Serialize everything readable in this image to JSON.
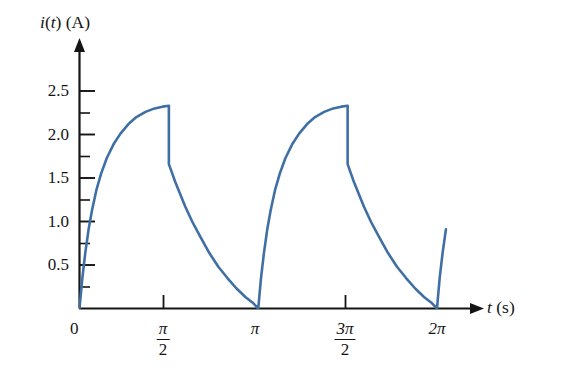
{
  "chart_data": {
    "type": "line",
    "title": "",
    "subtitle": "",
    "xlabel": "t (s)",
    "ylabel": "i(t) (A)",
    "xlim": [
      0,
      6.9115
    ],
    "ylim": [
      0,
      2.75
    ],
    "grid": false,
    "legend": null,
    "line_color": "#3f6fa5",
    "axis_color": "#141414",
    "period": 3.1416,
    "peak_value": 2.33,
    "x_ticks": [
      {
        "value": 0,
        "label": "0",
        "kind": "major"
      },
      {
        "value": 1.5708,
        "label": "pi/2",
        "kind": "major"
      },
      {
        "value": 3.1416,
        "label": "pi",
        "kind": "major"
      },
      {
        "value": 4.7124,
        "label": "3pi/2",
        "kind": "major"
      },
      {
        "value": 6.2832,
        "label": "2pi",
        "kind": "major"
      }
    ],
    "y_ticks": [
      {
        "value": 0.25,
        "label": "",
        "kind": "minor"
      },
      {
        "value": 0.5,
        "label": "0.5",
        "kind": "major"
      },
      {
        "value": 0.75,
        "label": "",
        "kind": "minor"
      },
      {
        "value": 1.0,
        "label": "1.0",
        "kind": "major"
      },
      {
        "value": 1.25,
        "label": "",
        "kind": "minor"
      },
      {
        "value": 1.5,
        "label": "1.5",
        "kind": "major"
      },
      {
        "value": 1.75,
        "label": "",
        "kind": "minor"
      },
      {
        "value": 2.0,
        "label": "2.0",
        "kind": "major"
      },
      {
        "value": 2.25,
        "label": "",
        "kind": "minor"
      },
      {
        "value": 2.5,
        "label": "2.5",
        "kind": "major"
      }
    ],
    "series": [
      {
        "name": "i(t)",
        "x": [
          0.0,
          0.05,
          0.1,
          0.16,
          0.22,
          0.3,
          0.38,
          0.48,
          0.6,
          0.72,
          0.86,
          1.0,
          1.16,
          1.32,
          1.46,
          1.5708,
          1.5708,
          1.62,
          1.68,
          1.76,
          1.86,
          1.98,
          2.12,
          2.28,
          2.44,
          2.6,
          2.76,
          2.92,
          3.04,
          3.1416,
          3.1416,
          3.19,
          3.24,
          3.3,
          3.36,
          3.44,
          3.52,
          3.62,
          3.74,
          3.86,
          4.0,
          4.14,
          4.3,
          4.46,
          4.6,
          4.7124,
          4.7124,
          4.76,
          4.82,
          4.9,
          5.0,
          5.12,
          5.26,
          5.42,
          5.58,
          5.74,
          5.9,
          6.06,
          6.18,
          6.2832,
          6.2832,
          6.33,
          6.38,
          6.44
        ],
        "y": [
          0.0,
          0.35,
          0.63,
          0.91,
          1.13,
          1.37,
          1.55,
          1.73,
          1.89,
          2.01,
          2.12,
          2.2,
          2.26,
          2.3,
          2.32,
          2.33,
          1.66,
          1.57,
          1.46,
          1.33,
          1.17,
          1.0,
          0.83,
          0.64,
          0.48,
          0.35,
          0.23,
          0.13,
          0.07,
          0.0,
          0.0,
          0.35,
          0.63,
          0.91,
          1.13,
          1.37,
          1.55,
          1.73,
          1.89,
          2.01,
          2.12,
          2.2,
          2.26,
          2.3,
          2.32,
          2.33,
          1.66,
          1.57,
          1.46,
          1.33,
          1.17,
          1.0,
          0.83,
          0.64,
          0.48,
          0.35,
          0.23,
          0.13,
          0.07,
          0.0,
          0.0,
          0.35,
          0.63,
          0.91
        ]
      }
    ]
  },
  "axes": {
    "y_axis_label_math": {
      "func": "i",
      "arg": "t",
      "unit": "(A)"
    },
    "x_axis_label_math": {
      "var": "t",
      "unit": "(s)"
    },
    "origin_label": "0"
  },
  "tick_labels": {
    "y": [
      "2.5",
      "2.0",
      "1.5",
      "1.0",
      "0.5"
    ],
    "x_pi_over_2": {
      "num": "π",
      "den": "2"
    },
    "x_pi": "π",
    "x_3pi_over_2": {
      "num": "3π",
      "den": "2"
    },
    "x_2pi": "2π"
  }
}
